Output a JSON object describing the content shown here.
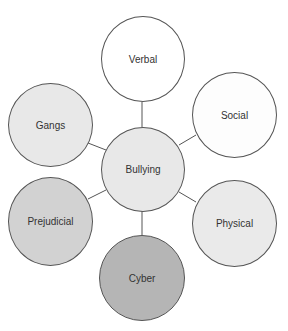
{
  "diagram": {
    "center": {
      "label": "Bullying",
      "fill": "#e8e8e8"
    },
    "nodes": [
      {
        "id": "verbal",
        "label": "Verbal",
        "fill": "#ffffff"
      },
      {
        "id": "social",
        "label": "Social",
        "fill": "#fdfdfd"
      },
      {
        "id": "physical",
        "label": "Physical",
        "fill": "#eaeaea"
      },
      {
        "id": "cyber",
        "label": "Cyber",
        "fill": "#b5b5b5"
      },
      {
        "id": "prejudicial",
        "label": "Prejudicial",
        "fill": "#d2d2d2"
      },
      {
        "id": "gangs",
        "label": "Gangs",
        "fill": "#e8e8e8"
      }
    ]
  }
}
